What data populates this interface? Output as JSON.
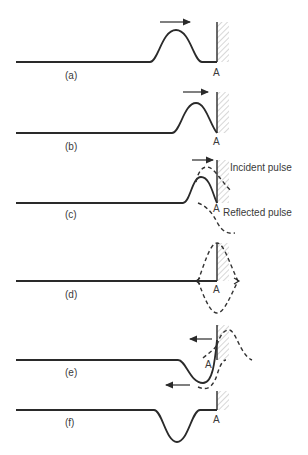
{
  "figure": {
    "wall_label": "A",
    "panels": [
      {
        "id": "a",
        "label": "(a)",
        "wall_label": "A"
      },
      {
        "id": "b",
        "label": "(b)",
        "wall_label": "A"
      },
      {
        "id": "c",
        "label": "(c)",
        "wall_label": "A",
        "annotations": [
          "Incident pulse",
          "Reflected pulse"
        ]
      },
      {
        "id": "d",
        "label": "(d)",
        "wall_label": "A"
      },
      {
        "id": "e",
        "label": "(e)",
        "wall_label": "A"
      },
      {
        "id": "f",
        "label": "(f)",
        "wall_label": "A"
      }
    ],
    "annotations": {
      "incident": "Incident pulse",
      "reflected": "Reflected pulse"
    },
    "colors": {
      "line": "#2a2a2a",
      "hatch": "#9a9a9a",
      "text": "#3a3a3a",
      "background": "#ffffff"
    }
  }
}
